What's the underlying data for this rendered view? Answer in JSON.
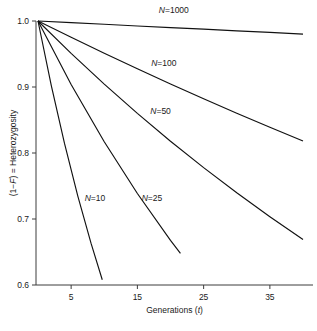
{
  "chart_data": {
    "type": "line",
    "title": "",
    "xlabel": "Generations (t)",
    "ylabel": "(1−F) = Heterozygosity",
    "xlabel_parts": {
      "text": "Generations (",
      "italic": "t",
      "tail": ")"
    },
    "ylabel_parts": {
      "lead": "(1−",
      "italic": "F",
      "tail": ") = Heterozygosity"
    },
    "xlim": [
      0,
      40
    ],
    "ylim": [
      0.6,
      1.0
    ],
    "xticks": [
      5,
      15,
      25,
      35
    ],
    "xtick_labels": [
      "5",
      "15",
      "25",
      "35"
    ],
    "yticks": [
      0.6,
      0.7,
      0.8,
      0.9,
      1.0
    ],
    "ytick_labels": [
      "0.6",
      "0.7",
      "0.8",
      "0.9",
      "1.0"
    ],
    "grid": false,
    "legend": "inline-labels",
    "formula": "H_t = (1 - 1/(2N))^t",
    "series": [
      {
        "name": "N=1000",
        "N": 1000,
        "label": "N=1000",
        "label_parts": {
          "italic": "N",
          "rest": "=1000"
        },
        "label_x": 20.5,
        "label_y": 1.012,
        "x": [
          0,
          5,
          10,
          15,
          20,
          25,
          30,
          35,
          40
        ],
        "values": [
          1.0,
          0.9975,
          0.995,
          0.9925,
          0.99,
          0.9876,
          0.9851,
          0.9827,
          0.9802
        ]
      },
      {
        "name": "N=100",
        "N": 100,
        "label": "N=100",
        "label_parts": {
          "italic": "N",
          "rest": "=100"
        },
        "label_x": 19.0,
        "label_y": 0.932,
        "x": [
          0,
          5,
          10,
          15,
          20,
          25,
          30,
          35,
          40
        ],
        "values": [
          1.0,
          0.9753,
          0.9511,
          0.9276,
          0.9046,
          0.8822,
          0.8603,
          0.8391,
          0.8183
        ]
      },
      {
        "name": "N=50",
        "N": 50,
        "label": "N=50",
        "label_parts": {
          "italic": "N",
          "rest": "=50"
        },
        "label_x": 18.5,
        "label_y": 0.859,
        "x": [
          0,
          5,
          10,
          15,
          20,
          25,
          30,
          35,
          40
        ],
        "values": [
          1.0,
          0.951,
          0.9044,
          0.8601,
          0.8179,
          0.7778,
          0.7397,
          0.7035,
          0.6689
        ]
      },
      {
        "name": "N=25",
        "N": 25,
        "label": "N=25",
        "label_parts": {
          "italic": "N",
          "rest": "=25"
        },
        "label_x": 17.2,
        "label_y": 0.728,
        "x": [
          0,
          5,
          10,
          15,
          20,
          21.5
        ],
        "values": [
          1.0,
          0.9039,
          0.8171,
          0.7386,
          0.6676,
          0.648
        ]
      },
      {
        "name": "N=10",
        "N": 10,
        "label": "N=10",
        "label_parts": {
          "italic": "N",
          "rest": "=10"
        },
        "label_x": 8.6,
        "label_y": 0.728,
        "x": [
          0,
          2,
          4,
          6,
          8,
          9.7
        ],
        "values": [
          1.0,
          0.9025,
          0.8145,
          0.7351,
          0.6634,
          0.608
        ]
      }
    ]
  },
  "colors": {
    "line": "#111111",
    "axis": "#3c3c3c",
    "text": "#1a1a1a",
    "background": "#ffffff"
  }
}
